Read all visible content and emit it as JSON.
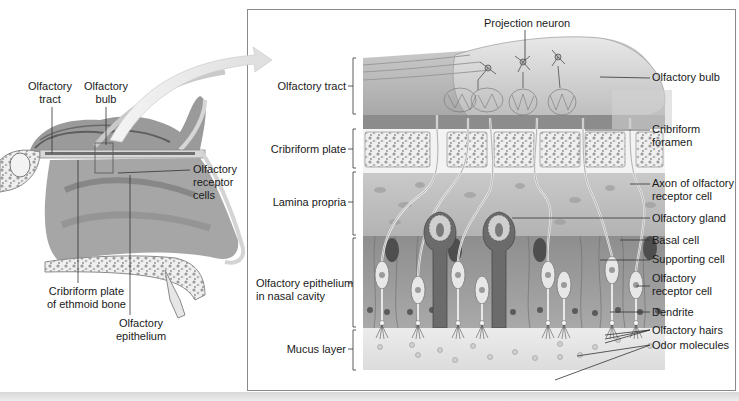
{
  "figure": {
    "topic": "Olfactory anatomy",
    "overview_labels": {
      "olfactory_tract": "Olfactory\ntract",
      "olfactory_bulb": "Olfactory\nbulb",
      "olfactory_receptor_cells": "Olfactory\nreceptor\ncells",
      "cribriform_plate_ethmoid": "Cribriform plate\nof ethmoid bone",
      "olfactory_epithelium": "Olfactory\nepithelium"
    },
    "detail_left_labels": [
      {
        "id": "olfactory-tract",
        "text": "Olfactory tract"
      },
      {
        "id": "cribriform-plate",
        "text": "Cribriform plate"
      },
      {
        "id": "lamina-propria",
        "text": "Lamina propria"
      },
      {
        "id": "olfactory-epithelium",
        "text": "Olfactory epithelium\nin nasal cavity"
      },
      {
        "id": "mucus-layer",
        "text": "Mucus layer"
      }
    ],
    "detail_top_label": "Projection neuron",
    "detail_right_labels": [
      {
        "id": "olfactory-bulb",
        "text": "Olfactory bulb"
      },
      {
        "id": "cribriform-foramen",
        "text": "Cribriform\nforamen"
      },
      {
        "id": "axon",
        "text": "Axon of olfactory\nreceptor cell"
      },
      {
        "id": "olfactory-gland",
        "text": "Olfactory gland"
      },
      {
        "id": "basal-cell",
        "text": "Basal cell"
      },
      {
        "id": "supporting-cell",
        "text": "Supporting cell"
      },
      {
        "id": "olfactory-receptor-cell",
        "text": "Olfactory\nreceptor cell"
      },
      {
        "id": "dendrite",
        "text": "Dendrite"
      },
      {
        "id": "olfactory-hairs",
        "text": "Olfactory hairs"
      },
      {
        "id": "odor-molecules",
        "text": "Odor molecules"
      }
    ]
  }
}
